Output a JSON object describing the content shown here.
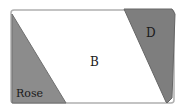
{
  "diagram": {
    "type": "area-partition",
    "regions": [
      {
        "id": "rose",
        "label": "Rose",
        "shape": "triangle",
        "fill": "#8a8a8a"
      },
      {
        "id": "b",
        "label": "B",
        "shape": "parallelogram",
        "fill": "#ffffff"
      },
      {
        "id": "d",
        "label": "D",
        "shape": "trapezoid",
        "fill": "#7a7a7a"
      }
    ],
    "outline_color": "#9a9a9a"
  }
}
